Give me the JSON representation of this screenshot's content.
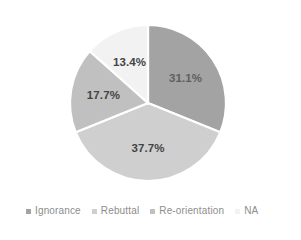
{
  "chart_data": {
    "type": "pie",
    "title": "",
    "subtitle": "",
    "xlabel": "",
    "ylabel": "",
    "grid": false,
    "legend_position": "bottom",
    "start_angle_deg": 0,
    "direction": "clockwise",
    "categories": [
      "Ignorance",
      "Rebuttal",
      "Re-orientation",
      "NA"
    ],
    "values": [
      31.1,
      37.7,
      17.7,
      13.4
    ],
    "data_labels": [
      "31.1%",
      "37.7%",
      "17.7%",
      "13.4%"
    ],
    "colors": [
      "#a3a3a3",
      "#cfcfcf",
      "#c0c0c0",
      "#f2f2f2"
    ],
    "slice_separator_color": "#ffffff",
    "slices": [
      {
        "label": "Ignorance",
        "value": 31.1,
        "data_label": "31.1%",
        "color": "#a3a3a3"
      },
      {
        "label": "Rebuttal",
        "value": 37.7,
        "data_label": "37.7%",
        "color": "#cfcfcf"
      },
      {
        "label": "Re-orientation",
        "value": 17.7,
        "data_label": "17.7%",
        "color": "#c0c0c0"
      },
      {
        "label": "NA",
        "value": 13.4,
        "data_label": "13.4%",
        "color": "#f2f2f2"
      }
    ]
  },
  "legend": {
    "items": [
      {
        "label": "Ignorance",
        "color": "#a3a3a3"
      },
      {
        "label": "Rebuttal",
        "color": "#cfcfcf"
      },
      {
        "label": "Re-orientation",
        "color": "#c0c0c0"
      },
      {
        "label": "NA",
        "color": "#f2f2f2"
      }
    ]
  }
}
